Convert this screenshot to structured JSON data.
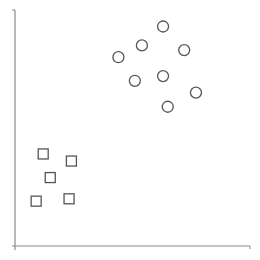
{
  "chart_data": {
    "type": "scatter",
    "title": "",
    "xlabel": "",
    "ylabel": "",
    "grid": false,
    "legend": null,
    "xlim": [
      0,
      100
    ],
    "ylim": [
      0,
      100
    ],
    "series": [
      {
        "name": "cluster-circles",
        "marker": "circle",
        "points": [
          {
            "x": 63,
            "y": 93
          },
          {
            "x": 54,
            "y": 85
          },
          {
            "x": 72,
            "y": 83
          },
          {
            "x": 44,
            "y": 80
          },
          {
            "x": 51,
            "y": 70
          },
          {
            "x": 63,
            "y": 72
          },
          {
            "x": 77,
            "y": 65
          },
          {
            "x": 65,
            "y": 59
          }
        ]
      },
      {
        "name": "cluster-squares",
        "marker": "square",
        "points": [
          {
            "x": 12,
            "y": 39
          },
          {
            "x": 24,
            "y": 36
          },
          {
            "x": 15,
            "y": 29
          },
          {
            "x": 9,
            "y": 19
          },
          {
            "x": 23,
            "y": 20
          }
        ]
      }
    ]
  },
  "style": {
    "axis_color": "#8a8a8a",
    "marker_stroke": "#555555",
    "marker_fill": "#ffffff",
    "background": "#ffffff"
  },
  "layout": {
    "origin_px": {
      "x": 15,
      "y": 246
    },
    "x_end_px": 250,
    "y_top_px": 10
  }
}
